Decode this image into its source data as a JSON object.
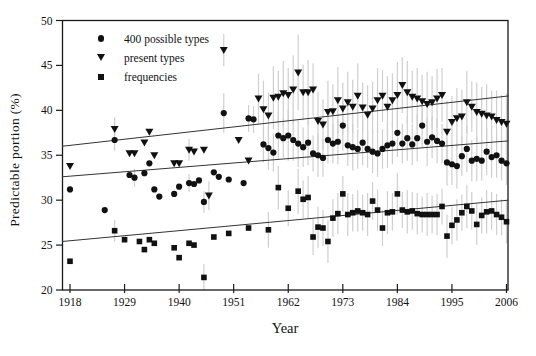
{
  "chart_data": {
    "type": "scatter",
    "title": "",
    "xlabel": "Year",
    "ylabel": "Predictable portion (%)",
    "x_ticks": [
      1918,
      1929,
      1940,
      1951,
      1962,
      1973,
      1984,
      1995,
      2006
    ],
    "y_ticks": [
      20,
      25,
      30,
      35,
      40,
      45,
      50
    ],
    "x_range": [
      1916.4,
      2006.4
    ],
    "y_range": [
      20,
      50
    ],
    "grid": "off",
    "legend_position": "top-left-inside",
    "colors": {
      "marker": "#111111",
      "error_bar": "#cfcfcf",
      "trend_line": "#333333",
      "axis": "#1a1a1a"
    },
    "series": [
      {
        "name": "400 possible types",
        "marker": "circle",
        "points": [
          [
            1918,
            31.2,
            0
          ],
          [
            1925,
            28.9,
            0
          ],
          [
            1927,
            36.7,
            1.2
          ],
          [
            1930,
            32.8,
            0
          ],
          [
            1931,
            32.5,
            1.0
          ],
          [
            1933,
            33.0,
            0
          ],
          [
            1934,
            34.1,
            0
          ],
          [
            1935,
            31.2,
            0
          ],
          [
            1936,
            30.4,
            0
          ],
          [
            1939,
            30.7,
            0
          ],
          [
            1940,
            31.5,
            0
          ],
          [
            1942,
            31.9,
            1.0
          ],
          [
            1943,
            31.8,
            0
          ],
          [
            1944,
            32.2,
            0
          ],
          [
            1945,
            29.8,
            1.2
          ],
          [
            1947,
            33.1,
            0
          ],
          [
            1948,
            32.6,
            0
          ],
          [
            1949,
            39.7,
            2.2
          ],
          [
            1950,
            32.3,
            0
          ],
          [
            1953,
            31.9,
            0
          ],
          [
            1954,
            39.1,
            1.5
          ],
          [
            1955,
            39.0,
            1.5
          ],
          [
            1957,
            36.2,
            2.0
          ],
          [
            1958,
            35.8,
            2.4
          ],
          [
            1959,
            35.3,
            2.1
          ],
          [
            1960,
            37.2,
            2.6
          ],
          [
            1961,
            36.9,
            2.2
          ],
          [
            1962,
            37.2,
            2.8
          ],
          [
            1963,
            36.7,
            2.3
          ],
          [
            1964,
            36.3,
            2.6
          ],
          [
            1965,
            35.9,
            2.2
          ],
          [
            1966,
            36.4,
            2.5
          ],
          [
            1967,
            35.2,
            2.0
          ],
          [
            1968,
            35.0,
            2.4
          ],
          [
            1969,
            34.7,
            2.1
          ],
          [
            1970,
            36.7,
            2.6
          ],
          [
            1971,
            36.3,
            2.2
          ],
          [
            1972,
            36.5,
            2.5
          ],
          [
            1973,
            38.3,
            2.8
          ],
          [
            1974,
            36.1,
            2.3
          ],
          [
            1975,
            35.9,
            2.6
          ],
          [
            1976,
            35.7,
            2.2
          ],
          [
            1977,
            36.4,
            2.5
          ],
          [
            1978,
            35.7,
            2.1
          ],
          [
            1979,
            35.4,
            2.4
          ],
          [
            1980,
            35.2,
            2.6
          ],
          [
            1981,
            35.7,
            2.2
          ],
          [
            1982,
            36.1,
            2.5
          ],
          [
            1983,
            36.3,
            2.3
          ],
          [
            1984,
            37.5,
            2.7
          ],
          [
            1985,
            36.3,
            2.2
          ],
          [
            1986,
            36.9,
            2.5
          ],
          [
            1987,
            36.2,
            2.3
          ],
          [
            1988,
            36.9,
            2.6
          ],
          [
            1989,
            38.3,
            2.4
          ],
          [
            1990,
            36.5,
            2.7
          ],
          [
            1991,
            37.0,
            2.3
          ],
          [
            1992,
            36.6,
            2.5
          ],
          [
            1993,
            36.3,
            2.2
          ],
          [
            1994,
            34.2,
            2.6
          ],
          [
            1995,
            34.0,
            2.3
          ],
          [
            1996,
            33.8,
            2.5
          ],
          [
            1997,
            34.9,
            2.2
          ],
          [
            1998,
            35.7,
            2.6
          ],
          [
            1999,
            34.4,
            2.3
          ],
          [
            2000,
            34.6,
            2.5
          ],
          [
            2001,
            34.4,
            2.2
          ],
          [
            2002,
            35.4,
            2.6
          ],
          [
            2003,
            34.8,
            2.3
          ],
          [
            2004,
            35.0,
            2.5
          ],
          [
            2005,
            34.4,
            2.2
          ],
          [
            2006,
            34.1,
            2.4
          ]
        ]
      },
      {
        "name": "present types",
        "marker": "triangle-down",
        "points": [
          [
            1918,
            33.8,
            0
          ],
          [
            1927,
            37.9,
            1.3
          ],
          [
            1930,
            35.2,
            0
          ],
          [
            1931,
            35.2,
            0
          ],
          [
            1933,
            36.4,
            0
          ],
          [
            1934,
            37.6,
            0
          ],
          [
            1935,
            35.0,
            0
          ],
          [
            1939,
            34.1,
            0
          ],
          [
            1940,
            34.1,
            0
          ],
          [
            1942,
            35.6,
            1.2
          ],
          [
            1943,
            35.4,
            0
          ],
          [
            1945,
            35.6,
            0
          ],
          [
            1946,
            30.5,
            1.6
          ],
          [
            1949,
            46.7,
            1.8
          ],
          [
            1952,
            36.7,
            0
          ],
          [
            1954,
            34.4,
            0
          ],
          [
            1956,
            41.3,
            2.8
          ],
          [
            1957,
            40.1,
            3.2
          ],
          [
            1958,
            39.4,
            2.6
          ],
          [
            1959,
            41.4,
            3.5
          ],
          [
            1960,
            41.5,
            2.9
          ],
          [
            1961,
            41.9,
            3.6
          ],
          [
            1962,
            41.7,
            3.0
          ],
          [
            1963,
            42.3,
            3.8
          ],
          [
            1964,
            44.2,
            4.2
          ],
          [
            1965,
            42.0,
            3.1
          ],
          [
            1966,
            42.0,
            3.6
          ],
          [
            1967,
            42.3,
            2.9
          ],
          [
            1968,
            38.8,
            3.3
          ],
          [
            1969,
            38.4,
            2.8
          ],
          [
            1970,
            39.8,
            3.5
          ],
          [
            1971,
            39.9,
            3.0
          ],
          [
            1972,
            41.1,
            3.7
          ],
          [
            1973,
            40.2,
            2.9
          ],
          [
            1974,
            40.9,
            3.4
          ],
          [
            1975,
            40.4,
            3.0
          ],
          [
            1976,
            41.6,
            3.6
          ],
          [
            1977,
            40.3,
            2.8
          ],
          [
            1978,
            39.5,
            3.3
          ],
          [
            1979,
            40.2,
            3.0
          ],
          [
            1980,
            41.1,
            3.6
          ],
          [
            1981,
            41.6,
            2.9
          ],
          [
            1982,
            40.4,
            3.4
          ],
          [
            1983,
            41.1,
            3.0
          ],
          [
            1984,
            41.7,
            3.7
          ],
          [
            1985,
            42.8,
            3.1
          ],
          [
            1986,
            42.0,
            3.5
          ],
          [
            1987,
            41.5,
            2.9
          ],
          [
            1988,
            41.3,
            3.4
          ],
          [
            1989,
            41.0,
            3.0
          ],
          [
            1990,
            40.7,
            3.6
          ],
          [
            1991,
            40.9,
            2.9
          ],
          [
            1992,
            41.3,
            3.3
          ],
          [
            1993,
            41.7,
            3.0
          ],
          [
            1994,
            37.6,
            3.5
          ],
          [
            1995,
            38.7,
            2.9
          ],
          [
            1996,
            39.1,
            3.4
          ],
          [
            1997,
            39.3,
            3.0
          ],
          [
            1998,
            40.9,
            3.5
          ],
          [
            1999,
            40.4,
            2.8
          ],
          [
            2000,
            39.8,
            3.3
          ],
          [
            2001,
            39.6,
            3.0
          ],
          [
            2002,
            39.4,
            3.5
          ],
          [
            2003,
            39.3,
            2.9
          ],
          [
            2004,
            38.9,
            3.3
          ],
          [
            2005,
            38.7,
            3.0
          ],
          [
            2006,
            38.5,
            3.4
          ]
        ]
      },
      {
        "name": "frequencies",
        "marker": "square",
        "points": [
          [
            1918,
            23.2,
            0
          ],
          [
            1927,
            26.6,
            1.2
          ],
          [
            1929,
            25.6,
            0
          ],
          [
            1932,
            25.4,
            0
          ],
          [
            1933,
            24.5,
            0
          ],
          [
            1934,
            25.6,
            0
          ],
          [
            1935,
            25.2,
            0
          ],
          [
            1939,
            24.7,
            0
          ],
          [
            1940,
            23.6,
            0
          ],
          [
            1942,
            25.2,
            0
          ],
          [
            1943,
            25.0,
            0
          ],
          [
            1945,
            21.4,
            1.5
          ],
          [
            1947,
            25.9,
            0
          ],
          [
            1950,
            26.3,
            0
          ],
          [
            1954,
            26.9,
            0
          ],
          [
            1958,
            26.7,
            2.0
          ],
          [
            1960,
            31.4,
            2.4
          ],
          [
            1962,
            29.1,
            2.0
          ],
          [
            1964,
            31.0,
            2.5
          ],
          [
            1965,
            30.1,
            2.1
          ],
          [
            1966,
            30.3,
            2.4
          ],
          [
            1967,
            25.9,
            2.0
          ],
          [
            1968,
            27.0,
            2.3
          ],
          [
            1969,
            26.9,
            2.0
          ],
          [
            1970,
            25.4,
            2.4
          ],
          [
            1971,
            28.0,
            2.1
          ],
          [
            1972,
            28.5,
            2.3
          ],
          [
            1973,
            30.7,
            2.0
          ],
          [
            1974,
            28.4,
            2.4
          ],
          [
            1975,
            28.6,
            2.1
          ],
          [
            1976,
            28.8,
            2.3
          ],
          [
            1977,
            28.6,
            2.0
          ],
          [
            1978,
            28.4,
            2.4
          ],
          [
            1979,
            29.9,
            2.1
          ],
          [
            1980,
            28.9,
            2.3
          ],
          [
            1981,
            26.9,
            2.0
          ],
          [
            1982,
            28.6,
            2.4
          ],
          [
            1983,
            28.7,
            2.1
          ],
          [
            1984,
            30.7,
            2.3
          ],
          [
            1985,
            28.9,
            2.0
          ],
          [
            1986,
            28.7,
            2.4
          ],
          [
            1987,
            28.8,
            2.1
          ],
          [
            1988,
            28.5,
            2.3
          ],
          [
            1989,
            28.4,
            2.0
          ],
          [
            1990,
            28.4,
            2.4
          ],
          [
            1991,
            28.4,
            2.1
          ],
          [
            1992,
            28.4,
            2.3
          ],
          [
            1993,
            29.3,
            2.0
          ],
          [
            1994,
            26.0,
            2.4
          ],
          [
            1995,
            27.2,
            2.1
          ],
          [
            1996,
            27.8,
            2.3
          ],
          [
            1997,
            28.6,
            2.0
          ],
          [
            1998,
            29.3,
            2.4
          ],
          [
            1999,
            28.8,
            2.1
          ],
          [
            2000,
            27.3,
            2.3
          ],
          [
            2001,
            28.3,
            2.0
          ],
          [
            2002,
            28.7,
            2.4
          ],
          [
            2003,
            28.8,
            2.1
          ],
          [
            2004,
            28.4,
            2.3
          ],
          [
            2005,
            28.1,
            2.0
          ],
          [
            2006,
            27.6,
            2.4
          ]
        ]
      }
    ],
    "trend_lines": [
      {
        "series": "present types",
        "x_start": 1916.4,
        "y_start": 36.0,
        "x_end": 2006.4,
        "y_end": 41.6
      },
      {
        "series": "400 possible types",
        "x_start": 1916.4,
        "y_start": 32.6,
        "x_end": 2006.4,
        "y_end": 36.6
      },
      {
        "series": "frequencies",
        "x_start": 1916.4,
        "y_start": 25.4,
        "x_end": 2006.4,
        "y_end": 30.0
      }
    ],
    "plot_px": {
      "left": 62.5,
      "top": 20.5,
      "right": 508,
      "bottom": 290,
      "x1918_px": 70,
      "x2006_px": 506.5
    }
  }
}
